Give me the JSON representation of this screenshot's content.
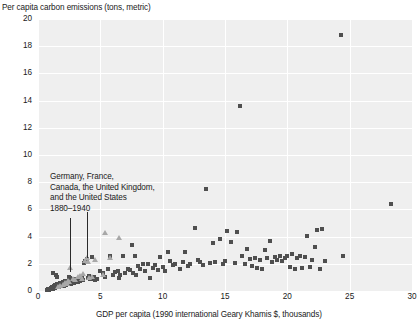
{
  "chart_data": {
    "type": "scatter",
    "title": "",
    "ylabel": "Per capita carbon emissions (tons, metric)",
    "xlabel": "GDP per capita (1990 international Geary Khamis $, thousands)",
    "xlim": [
      0,
      30
    ],
    "ylim": [
      0,
      20
    ],
    "xticks": [
      0,
      5,
      10,
      15,
      20,
      25,
      30
    ],
    "yticks": [
      0,
      2,
      4,
      6,
      8,
      10,
      12,
      14,
      16,
      18,
      20
    ],
    "grid": true,
    "legend_position": "none",
    "annotations": [
      {
        "lines": [
          "Germany, France,",
          "Canada, the United Kingdom,",
          "and the United States",
          "1880–1940"
        ],
        "points_to": [
          2.6,
          3.9
        ]
      }
    ],
    "series": [
      {
        "name": "All countries",
        "marker": "square",
        "color": "#4f4f4f",
        "points": [
          [
            0.7,
            0.08
          ],
          [
            0.8,
            0.12
          ],
          [
            0.9,
            0.1
          ],
          [
            1.0,
            0.15
          ],
          [
            1.05,
            0.2
          ],
          [
            1.1,
            0.12
          ],
          [
            1.15,
            0.3
          ],
          [
            1.2,
            0.18
          ],
          [
            1.25,
            0.25
          ],
          [
            1.3,
            0.35
          ],
          [
            1.35,
            0.2
          ],
          [
            1.4,
            0.42
          ],
          [
            1.45,
            0.3
          ],
          [
            1.5,
            0.5
          ],
          [
            1.55,
            0.28
          ],
          [
            1.6,
            0.38
          ],
          [
            1.65,
            0.55
          ],
          [
            1.7,
            0.32
          ],
          [
            1.75,
            0.45
          ],
          [
            1.8,
            0.6
          ],
          [
            1.85,
            0.35
          ],
          [
            1.9,
            0.5
          ],
          [
            1.95,
            0.42
          ],
          [
            2.0,
            0.65
          ],
          [
            2.05,
            0.38
          ],
          [
            2.1,
            0.55
          ],
          [
            2.15,
            0.48
          ],
          [
            2.2,
            0.7
          ],
          [
            2.25,
            0.45
          ],
          [
            2.3,
            0.6
          ],
          [
            2.35,
            0.52
          ],
          [
            2.4,
            0.75
          ],
          [
            2.45,
            0.5
          ],
          [
            2.5,
            0.68
          ],
          [
            2.55,
            0.58
          ],
          [
            2.6,
            0.8
          ],
          [
            2.65,
            0.55
          ],
          [
            2.7,
            0.72
          ],
          [
            2.75,
            0.62
          ],
          [
            2.8,
            0.85
          ],
          [
            1.2,
            1.35
          ],
          [
            1.45,
            1.15
          ],
          [
            1.55,
            1.05
          ],
          [
            2.45,
            1.05
          ],
          [
            2.6,
            0.95
          ],
          [
            2.9,
            0.6
          ],
          [
            3.0,
            0.78
          ],
          [
            3.1,
            0.88
          ],
          [
            3.2,
            0.65
          ],
          [
            3.3,
            0.95
          ],
          [
            3.4,
            0.72
          ],
          [
            3.5,
            1.0
          ],
          [
            3.6,
            0.82
          ],
          [
            3.7,
            2.05
          ],
          [
            3.8,
            2.2
          ],
          [
            3.9,
            2.35
          ],
          [
            4.0,
            0.95
          ],
          [
            4.1,
            1.1
          ],
          [
            4.2,
            0.85
          ],
          [
            4.3,
            2.5
          ],
          [
            4.4,
            0.9
          ],
          [
            4.5,
            1.0
          ],
          [
            4.6,
            0.78
          ],
          [
            4.7,
            0.88
          ],
          [
            5.0,
            1.45
          ],
          [
            5.2,
            1.3
          ],
          [
            5.4,
            1.05
          ],
          [
            5.6,
            1.6
          ],
          [
            5.8,
            2.55
          ],
          [
            6.0,
            1.15
          ],
          [
            6.2,
            1.4
          ],
          [
            6.4,
            1.5
          ],
          [
            6.6,
            1.2
          ],
          [
            6.8,
            2.55
          ],
          [
            7.0,
            1.35
          ],
          [
            7.2,
            1.65
          ],
          [
            7.4,
            1.55
          ],
          [
            7.5,
            3.35
          ],
          [
            7.6,
            1.3
          ],
          [
            7.8,
            2.6
          ],
          [
            8.0,
            1.85
          ],
          [
            8.2,
            1.6
          ],
          [
            8.4,
            2.0
          ],
          [
            8.6,
            1.45
          ],
          [
            8.8,
            1.95
          ],
          [
            9.0,
            0.95
          ],
          [
            9.2,
            1.7
          ],
          [
            9.4,
            1.9
          ],
          [
            9.6,
            1.55
          ],
          [
            10.0,
            1.75
          ],
          [
            10.4,
            2.85
          ],
          [
            10.8,
            1.9
          ],
          [
            11.0,
            2.0
          ],
          [
            11.4,
            1.6
          ],
          [
            11.8,
            2.9
          ],
          [
            12.2,
            1.95
          ],
          [
            12.6,
            4.6
          ],
          [
            13.0,
            2.1
          ],
          [
            13.5,
            7.5
          ],
          [
            13.8,
            2.05
          ],
          [
            14.0,
            3.5
          ],
          [
            14.2,
            2.15
          ],
          [
            14.6,
            3.8
          ],
          [
            14.8,
            2.0
          ],
          [
            15.0,
            2.2
          ],
          [
            15.2,
            4.4
          ],
          [
            15.5,
            3.6
          ],
          [
            15.8,
            2.05
          ],
          [
            16.0,
            4.35
          ],
          [
            16.2,
            13.6
          ],
          [
            16.4,
            2.6
          ],
          [
            16.6,
            1.95
          ],
          [
            16.8,
            3.1
          ],
          [
            17.0,
            2.35
          ],
          [
            17.2,
            1.85
          ],
          [
            17.4,
            2.45
          ],
          [
            17.6,
            1.7
          ],
          [
            17.8,
            2.25
          ],
          [
            18.0,
            1.6
          ],
          [
            18.2,
            3.05
          ],
          [
            18.4,
            2.4
          ],
          [
            18.6,
            3.7
          ],
          [
            18.8,
            2.15
          ],
          [
            19.0,
            2.5
          ],
          [
            19.2,
            2.3
          ],
          [
            19.4,
            2.6
          ],
          [
            19.6,
            2.2
          ],
          [
            19.8,
            2.45
          ],
          [
            20.0,
            2.55
          ],
          [
            20.2,
            1.75
          ],
          [
            20.4,
            2.7
          ],
          [
            20.6,
            1.65
          ],
          [
            20.8,
            2.4
          ],
          [
            21.0,
            2.6
          ],
          [
            21.2,
            1.7
          ],
          [
            21.4,
            2.5
          ],
          [
            21.6,
            4.05
          ],
          [
            21.8,
            1.75
          ],
          [
            22.0,
            2.3
          ],
          [
            22.2,
            3.25
          ],
          [
            22.4,
            4.5
          ],
          [
            22.6,
            1.65
          ],
          [
            22.8,
            4.55
          ],
          [
            23.0,
            2.2
          ],
          [
            24.3,
            18.8
          ],
          [
            24.5,
            2.55
          ],
          [
            28.3,
            6.4
          ],
          [
            11.6,
            2.1
          ],
          [
            12.0,
            1.85
          ],
          [
            12.8,
            2.3
          ],
          [
            13.2,
            1.9
          ],
          [
            9.8,
            2.5
          ],
          [
            10.2,
            1.5
          ],
          [
            10.6,
            2.2
          ],
          [
            6.5,
            0.95
          ],
          [
            7.9,
            1.15
          ]
        ]
      },
      {
        "name": "Germany, France, Canada, the United Kingdom, and the United States 1880–1940",
        "marker": "triangle",
        "color": "#a8a8a8",
        "points": [
          [
            1.6,
            0.35
          ],
          [
            1.8,
            0.42
          ],
          [
            2.0,
            0.5
          ],
          [
            2.2,
            0.62
          ],
          [
            2.4,
            0.75
          ],
          [
            2.6,
            1.75
          ],
          [
            2.8,
            0.95
          ],
          [
            3.0,
            0.85
          ],
          [
            3.2,
            1.05
          ],
          [
            3.4,
            1.15
          ],
          [
            3.6,
            1.3
          ],
          [
            3.8,
            2.25
          ],
          [
            3.9,
            2.45
          ],
          [
            4.1,
            1.0
          ],
          [
            4.3,
            1.1
          ],
          [
            4.6,
            2.35
          ],
          [
            5.4,
            4.3
          ],
          [
            5.2,
            1.2
          ],
          [
            5.8,
            2.5
          ],
          [
            6.5,
            3.9
          ],
          [
            2.3,
            0.55
          ],
          [
            2.5,
            0.68
          ],
          [
            3.5,
            0.92
          ],
          [
            4.0,
            2.15
          ]
        ]
      }
    ]
  }
}
